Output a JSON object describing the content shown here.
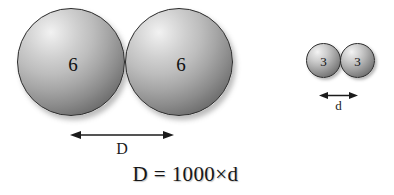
{
  "figure": {
    "equation": "D = 1000×d",
    "spheres": [
      {
        "name": "big-left",
        "label": "6",
        "size": "large"
      },
      {
        "name": "big-right",
        "label": "6",
        "size": "large"
      },
      {
        "name": "small-left",
        "label": "3",
        "size": "small"
      },
      {
        "name": "small-right",
        "label": "3",
        "size": "small"
      }
    ],
    "dimensions": [
      {
        "name": "D",
        "label": "D",
        "belongs_to": "large-sphere-pair"
      },
      {
        "name": "d",
        "label": "d",
        "belongs_to": "small-sphere-pair"
      }
    ],
    "colors": {
      "background": "#ffffff",
      "sphere_outline": "#2b2b2b",
      "sphere_highlight": "#f2f2f2",
      "sphere_shadow": "#474747",
      "text": "#161616",
      "arrow": "#1b1b1b"
    }
  }
}
